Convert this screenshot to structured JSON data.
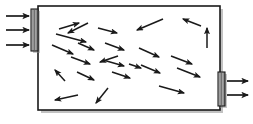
{
  "figure": {
    "name": "gas-particle-velocity-diagram",
    "background_color": "#ffffff",
    "width": 253,
    "height": 124
  },
  "colors": {
    "stroke": "#1a1a1a",
    "chamber_fill": "#ffffff",
    "membrane_fill": "#9a9a9a",
    "membrane_highlight": "#c9c9c9",
    "membrane_stroke": "#1a1a1a",
    "shadow": "#8c8c8c"
  },
  "chamber": {
    "label": "chamber",
    "x": 38,
    "y": 6,
    "width": 182,
    "height": 104,
    "stroke_width": 1.6
  },
  "membranes": [
    {
      "name": "inlet-membrane",
      "side": "left",
      "x": 31,
      "y": 9,
      "width": 7,
      "height": 42
    },
    {
      "name": "outlet-membrane",
      "side": "right",
      "x": 218,
      "y": 72,
      "width": 7,
      "height": 34
    }
  ],
  "inlet_arrows": {
    "label": "inlet-flow-arrows",
    "count": 3,
    "direction": "right",
    "items": [
      {
        "x1": 6,
        "y1": 16,
        "x2": 29,
        "y2": 16
      },
      {
        "x1": 6,
        "y1": 30,
        "x2": 29,
        "y2": 30
      },
      {
        "x1": 6,
        "y1": 45,
        "x2": 29,
        "y2": 45
      }
    ]
  },
  "outlet_arrows": {
    "label": "outlet-flow-arrows",
    "count": 2,
    "direction": "right",
    "items": [
      {
        "x1": 227,
        "y1": 81,
        "x2": 248,
        "y2": 81
      },
      {
        "x1": 227,
        "y1": 95,
        "x2": 248,
        "y2": 95
      }
    ]
  },
  "particle_velocity_arrows": {
    "label": "particle-velocity-vectors",
    "count": 24,
    "items": [
      {
        "id": 1,
        "x1": 59,
        "y1": 29,
        "x2": 79,
        "y2": 23
      },
      {
        "id": 2,
        "x1": 98,
        "y1": 28,
        "x2": 117,
        "y2": 33
      },
      {
        "id": 3,
        "x1": 56,
        "y1": 34,
        "x2": 86,
        "y2": 42
      },
      {
        "id": 4,
        "x1": 52,
        "y1": 45,
        "x2": 73,
        "y2": 54
      },
      {
        "id": 5,
        "x1": 78,
        "y1": 43,
        "x2": 94,
        "y2": 50
      },
      {
        "id": 6,
        "x1": 105,
        "y1": 43,
        "x2": 124,
        "y2": 50
      },
      {
        "id": 7,
        "x1": 71,
        "y1": 57,
        "x2": 90,
        "y2": 64
      },
      {
        "id": 8,
        "x1": 103,
        "y1": 60,
        "x2": 124,
        "y2": 66
      },
      {
        "id": 9,
        "x1": 77,
        "y1": 72,
        "x2": 94,
        "y2": 80
      },
      {
        "id": 10,
        "x1": 112,
        "y1": 72,
        "x2": 130,
        "y2": 78
      },
      {
        "id": 11,
        "x1": 65,
        "y1": 81,
        "x2": 55,
        "y2": 70
      },
      {
        "id": 12,
        "x1": 78,
        "y1": 95,
        "x2": 55,
        "y2": 100
      },
      {
        "id": 13,
        "x1": 108,
        "y1": 88,
        "x2": 96,
        "y2": 103
      },
      {
        "id": 14,
        "x1": 163,
        "y1": 19,
        "x2": 137,
        "y2": 30
      },
      {
        "id": 15,
        "x1": 201,
        "y1": 26,
        "x2": 183,
        "y2": 19
      },
      {
        "id": 16,
        "x1": 207,
        "y1": 48,
        "x2": 207,
        "y2": 28
      },
      {
        "id": 17,
        "x1": 139,
        "y1": 48,
        "x2": 159,
        "y2": 57
      },
      {
        "id": 18,
        "x1": 171,
        "y1": 56,
        "x2": 192,
        "y2": 64
      },
      {
        "id": 19,
        "x1": 141,
        "y1": 65,
        "x2": 160,
        "y2": 73
      },
      {
        "id": 20,
        "x1": 177,
        "y1": 68,
        "x2": 200,
        "y2": 77
      },
      {
        "id": 21,
        "x1": 159,
        "y1": 86,
        "x2": 184,
        "y2": 93
      },
      {
        "id": 22,
        "x1": 129,
        "y1": 64,
        "x2": 141,
        "y2": 68
      },
      {
        "id": 23,
        "x1": 88,
        "y1": 23,
        "x2": 68,
        "y2": 33
      },
      {
        "id": 24,
        "x1": 118,
        "y1": 56,
        "x2": 100,
        "y2": 62
      }
    ]
  }
}
